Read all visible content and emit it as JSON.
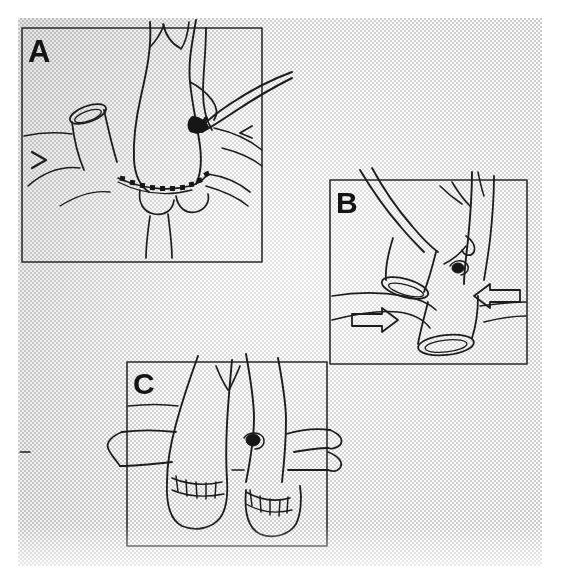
{
  "figure": {
    "type": "medical-illustration",
    "style": "halftone scanned line drawing",
    "panel_count": 3,
    "background_color": "#eeeeee",
    "ink_color": "#1a1a1a",
    "canvas": {
      "width": 564,
      "height": 583
    },
    "scan_area": {
      "x": 18,
      "y": 18,
      "width": 524,
      "height": 548
    }
  },
  "panels": [
    {
      "id": "A",
      "label": "A",
      "frame": {
        "x": 22,
        "y": 28,
        "width": 240,
        "height": 234
      },
      "description": "Posterior suture row of an end-to-side vascular anastomosis; vessel held with a curved forceps entering from upper right, interrupted suture dots along the anastomotic line, transected vessel stump with open oval lumen at left, small solid arrowhead marker at far left.",
      "features": [
        "curved-forceps-instrument",
        "dotted-suture-line",
        "open-vessel-lumen",
        "arrowhead-marker",
        "branching-vessel-trunk"
      ]
    },
    {
      "id": "B",
      "label": "B",
      "frame": {
        "x": 330,
        "y": 180,
        "width": 197,
        "height": 184
      },
      "description": "Two transected vessel stumps with open elliptical lumens displaced in opposite directions; paired hollow outline arrows indicate the direction of traction/mobilisation of each stump.",
      "features": [
        "open-vessel-lumen-upper",
        "open-vessel-lumen-lower",
        "hollow-arrow-right",
        "hollow-arrow-left",
        "suture-tie-knot"
      ]
    },
    {
      "id": "C",
      "label": "C",
      "frame": {
        "x": 127,
        "y": 362,
        "width": 200,
        "height": 184
      },
      "description": "Completed repair: two parallel vessel limbs with finished interrupted suture rows shown as ladder-like stitch marks across each anastomosis, lateral branch extending to the left and a bifurcating branch to the right.",
      "features": [
        "completed-anastomosis-left",
        "completed-anastomosis-right",
        "stitch-marks-ladder",
        "lateral-branch-left",
        "bifurcating-branch-right",
        "dark-ostium-spot"
      ]
    }
  ],
  "annotations": {
    "arrows": [
      {
        "panel": "B",
        "direction": "right",
        "style": "hollow-outline"
      },
      {
        "panel": "B",
        "direction": "left",
        "style": "hollow-outline"
      },
      {
        "panel": "A",
        "direction": "right",
        "style": "small-solid-caret"
      },
      {
        "panel": "A",
        "direction": "left",
        "style": "small-solid-caret"
      }
    ]
  }
}
